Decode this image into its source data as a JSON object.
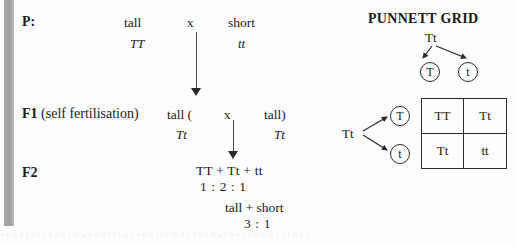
{
  "diagram": {
    "generations": {
      "p": {
        "label": "P:",
        "parent_left_pheno": "tall",
        "cross_symbol": "x",
        "parent_right_pheno": "short",
        "parent_left_geno": "TT",
        "parent_right_geno": "tt"
      },
      "f1": {
        "label_bold": "F1",
        "label_rest": " (self fertilisation)",
        "left_pheno": "tall (",
        "cross_symbol": "x",
        "right_pheno": "tall)",
        "left_geno": "Tt",
        "right_geno": "Tt"
      },
      "f2": {
        "label": "F2",
        "genotypes": "TT + Tt + tt",
        "genotype_ratio": "1  :  2 :  1",
        "phenotypes": "tall + short",
        "phenotype_ratio": "3 :   1"
      }
    }
  },
  "punnett": {
    "title": "PUNNETT GRID",
    "top_parent": "Tt",
    "left_parent": "Tt",
    "top_gametes": [
      "T",
      "t"
    ],
    "left_gametes": [
      "T",
      "t"
    ],
    "cells": [
      [
        "TT",
        "Tt"
      ],
      [
        "Tt",
        "tt"
      ]
    ]
  },
  "scan": {
    "bleed_text": "a e  u  n  l  e  r  t  h  s  o  i  m  a  n  e  d  t  r  l  o  s  e  n  a  t  i  r  m  d  e  l  o  s  n  a  t  h  e  r  i  m  o  d  s  e  l  n  a  t"
  },
  "colors": {
    "ink": "#1a1a1a",
    "rule": "#2a2a2a",
    "paper": "#fdfdfd",
    "gutter": "#a6a6a6"
  }
}
